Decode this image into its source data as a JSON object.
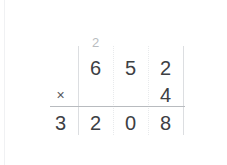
{
  "problem": {
    "type": "long-multiplication",
    "multiplicand": "652",
    "multiplier": "4",
    "product": "3208",
    "operator": "×"
  },
  "carry_row": {
    "cells": [
      "",
      "2",
      "",
      ""
    ]
  },
  "multiplicand_row": {
    "cells": [
      "",
      "6",
      "5",
      "2"
    ]
  },
  "multiplier_row": {
    "operator": "×",
    "cells": [
      "",
      "",
      "",
      "4"
    ]
  },
  "answer_row": {
    "cells": [
      "3",
      "2",
      "0",
      "8"
    ]
  },
  "colors": {
    "digit": "#3d4044",
    "carry": "#b9bcc0",
    "operator": "#55585c",
    "rule": "#b8bbbf",
    "column_solid": "#dcdee1",
    "column_dotted": "#e8eaec",
    "background": "#ffffff"
  }
}
